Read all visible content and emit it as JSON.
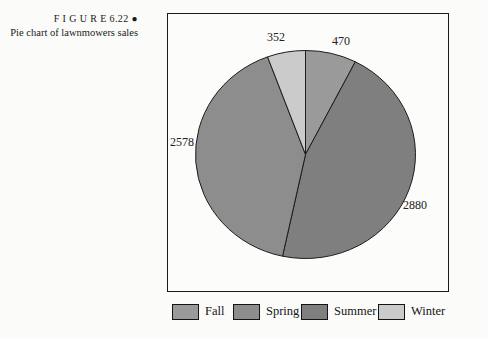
{
  "figure": {
    "label": "F I G U R E  6.22 ●",
    "title": "Pie chart of lawnmowers sales"
  },
  "chart_data": {
    "type": "pie",
    "title": "Pie chart of lawnmowers sales",
    "categories": [
      "Fall",
      "Spring",
      "Summer",
      "Winter"
    ],
    "values": [
      470,
      2578,
      2880,
      352
    ],
    "total": 6280,
    "slices": [
      {
        "label": "Fall",
        "value": 470,
        "color": "#9a9a9a"
      },
      {
        "label": "Spring",
        "value": 2578,
        "color": "#8d8d8d"
      },
      {
        "label": "Summer",
        "value": 2880,
        "color": "#7f7f7f"
      },
      {
        "label": "Winter",
        "value": 352,
        "color": "#cbcbcb"
      }
    ],
    "pie_order": [
      "Fall",
      "Summer",
      "Spring",
      "Winter"
    ],
    "start_angle_deg": 0,
    "direction": "clockwise",
    "outline_color": "#1c1c1c",
    "legend_position": "bottom",
    "data_labels": "outside"
  }
}
